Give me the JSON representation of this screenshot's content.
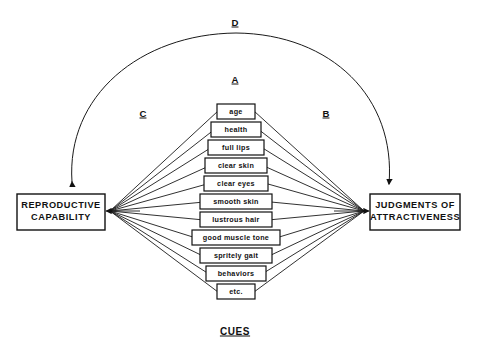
{
  "diagram": {
    "background_color": "#ffffff",
    "line_color": "#1a1a1a",
    "box_fill": "#ffffff",
    "box_stroke": "#111111",
    "left_node": {
      "label_line1": "REPRODUCTIVE",
      "label_line2": "CAPABILITY"
    },
    "right_node": {
      "label_line1": "JUDGMENTS OF",
      "label_line2": "ATTRACTIVENESS"
    },
    "cues_caption": "CUES",
    "cues": [
      {
        "label": "age"
      },
      {
        "label": "health"
      },
      {
        "label": "full lips"
      },
      {
        "label": "clear skin"
      },
      {
        "label": "clear eyes"
      },
      {
        "label": "smooth skin"
      },
      {
        "label": "lustrous hair"
      },
      {
        "label": "good muscle  tone"
      },
      {
        "label": "spritely  gait"
      },
      {
        "label": "behaviors"
      },
      {
        "label": "etc."
      }
    ],
    "path_labels": [
      {
        "name": "A",
        "label": "A"
      },
      {
        "name": "B",
        "label": "B"
      },
      {
        "name": "C",
        "label": "C"
      },
      {
        "name": "D",
        "label": "D"
      }
    ]
  }
}
